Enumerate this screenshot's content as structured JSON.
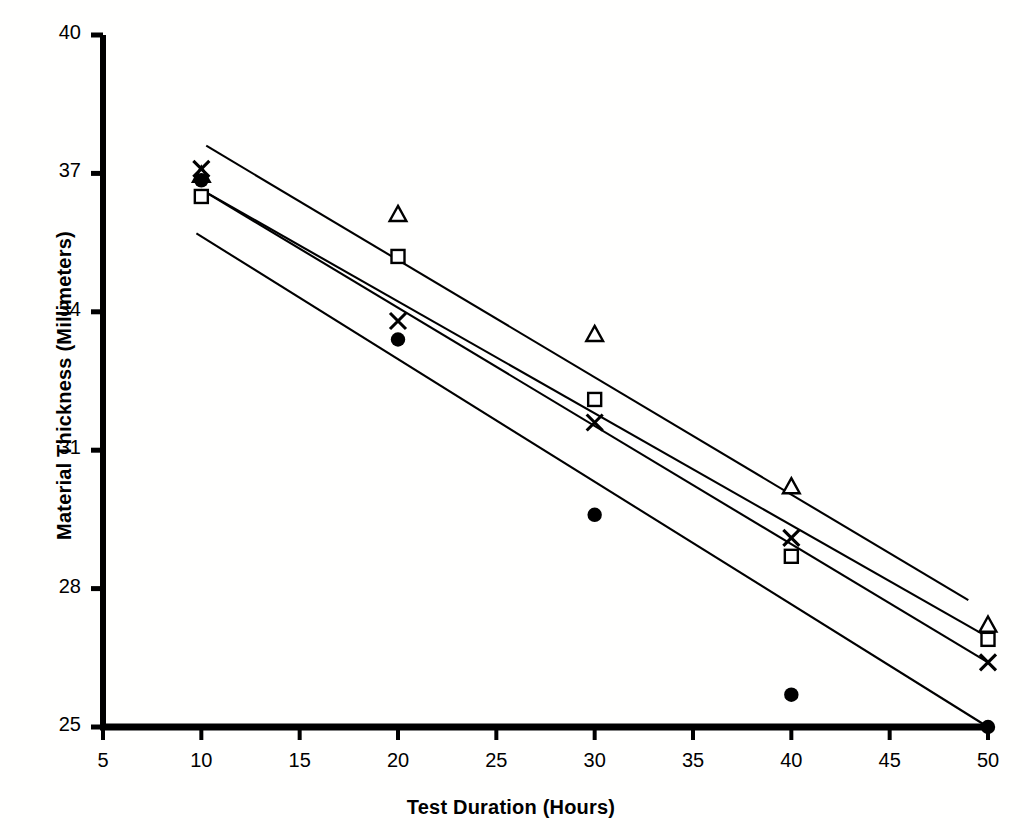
{
  "chart_data": {
    "type": "scatter",
    "title": "",
    "subtitle": "",
    "xlabel": "Test Duration (Hours)",
    "ylabel": "Material Thickness (Millimeters)",
    "xlim": [
      5,
      50
    ],
    "ylim": [
      25,
      40
    ],
    "xticks": [
      5,
      10,
      15,
      20,
      25,
      30,
      35,
      40,
      45,
      50
    ],
    "yticks": [
      25,
      28,
      31,
      34,
      37,
      40
    ],
    "xtick_labels": [
      "5",
      "10",
      "15",
      "20",
      "25",
      "30",
      "35",
      "40",
      "45",
      "50"
    ],
    "ytick_labels": [
      "25",
      "28",
      "31",
      "34",
      "37",
      "40"
    ],
    "grid": false,
    "legend": "none",
    "x": [
      10,
      20,
      30,
      40,
      50
    ],
    "series": [
      {
        "name": "triangle-series",
        "marker": "triangle-open",
        "values": [
          36.95,
          36.1,
          33.5,
          30.2,
          27.2
        ]
      },
      {
        "name": "square-series",
        "marker": "square-open",
        "values": [
          36.5,
          35.2,
          32.1,
          28.7,
          26.9
        ]
      },
      {
        "name": "cross-series",
        "marker": "x-cross",
        "values": [
          37.1,
          33.8,
          31.6,
          29.1,
          26.4
        ]
      },
      {
        "name": "circle-series",
        "marker": "circle-filled",
        "values": [
          36.85,
          33.4,
          29.6,
          25.7,
          25.0
        ]
      }
    ],
    "trend_lines": [
      {
        "name": "trend-line-1",
        "x0": 10.25,
        "y0": 37.6,
        "x1": 49.0,
        "y1": 27.75
      },
      {
        "name": "trend-line-2",
        "x0": 10.0,
        "y0": 36.65,
        "x1": 50.0,
        "y1": 26.95
      },
      {
        "name": "trend-line-3",
        "x0": 10.0,
        "y0": 36.65,
        "x1": 50.0,
        "y1": 26.4
      },
      {
        "name": "trend-line-4",
        "x0": 9.75,
        "y0": 35.7,
        "x1": 50.0,
        "y1": 25.0
      }
    ],
    "colors": {
      "axis": "#000000",
      "marker": "#000000",
      "line": "#000000",
      "background": "#ffffff"
    }
  }
}
